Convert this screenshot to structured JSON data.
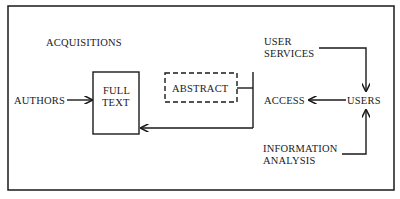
{
  "diagram": {
    "nodes": {
      "acquisitions": {
        "label": "ACQUISITIONS"
      },
      "authors": {
        "label": "AUTHORS"
      },
      "full_text": {
        "line1": "FULL",
        "line2": "TEXT"
      },
      "abstract": {
        "label": "ABSTRACT",
        "style": "dashed"
      },
      "user_services": {
        "line1": "USER",
        "line2": "SERVICES"
      },
      "access": {
        "label": "ACCESS"
      },
      "users": {
        "label": "USERS"
      },
      "information_analysis": {
        "line1": "INFORMATION",
        "line2": "ANALYSIS"
      }
    },
    "edges": [
      {
        "from": "AUTHORS",
        "to": "FULL TEXT"
      },
      {
        "from": "ABSTRACT",
        "to": "FULL TEXT",
        "via": "bracket line"
      },
      {
        "from": "USER SERVICES",
        "to": "USERS"
      },
      {
        "from": "INFORMATION ANALYSIS",
        "to": "USERS"
      },
      {
        "from": "USERS",
        "to": "ACCESS"
      }
    ],
    "colors": {
      "ink": "#1a1a1a",
      "background": "#ffffff"
    }
  }
}
